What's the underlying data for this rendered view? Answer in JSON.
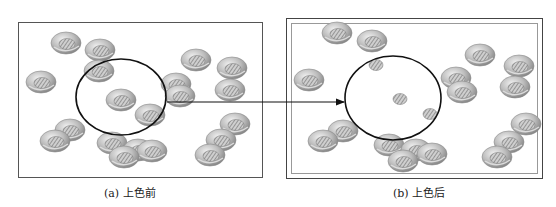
{
  "figure": {
    "panels": [
      {
        "id": "a",
        "caption": "(a) 上色前",
        "nut_count": 20
      },
      {
        "id": "b",
        "caption": "(b) 上色后",
        "nut_count": 20
      }
    ],
    "annotation": {
      "type": "circle-with-arrow",
      "from_panel": "a",
      "to_panel": "b"
    },
    "colors": {
      "outline": "#111111",
      "nut_shade": "#9a9a9a",
      "nut_highlight": "#e6e6e6",
      "frame": "#555555"
    }
  }
}
